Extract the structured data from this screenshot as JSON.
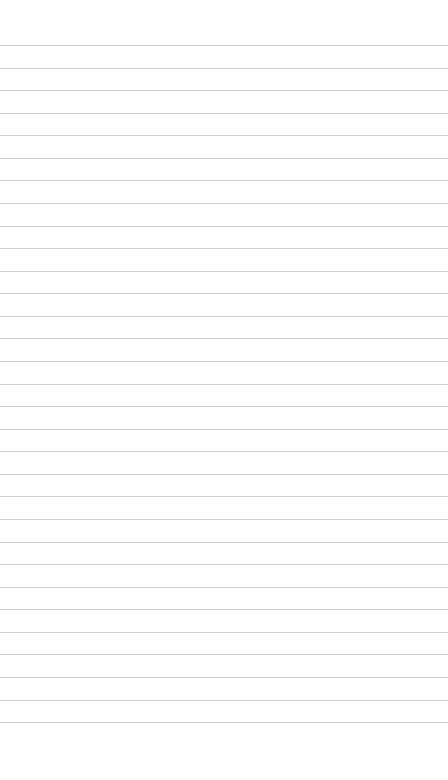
{
  "note": {
    "text": "",
    "ruled_lines": {
      "count": 31,
      "first_y": 45,
      "spacing": 22.57,
      "color": "#cfcfcf"
    },
    "background_color": "#ffffff"
  }
}
